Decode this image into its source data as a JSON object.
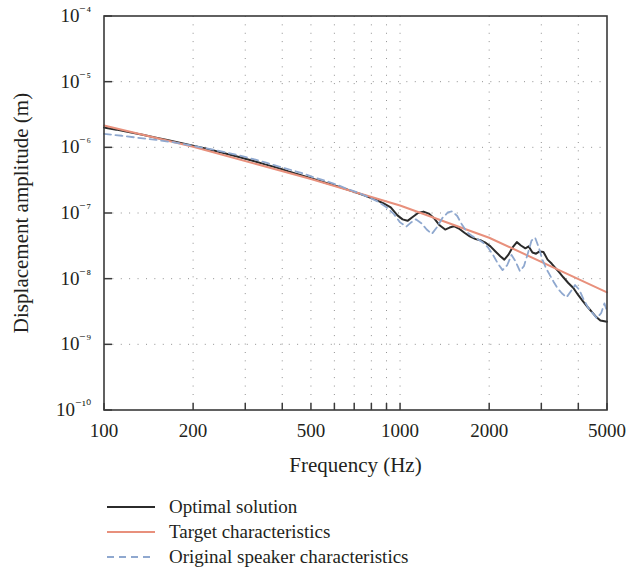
{
  "chart_data": {
    "type": "line",
    "title": "",
    "xlabel": "Frequency (Hz)",
    "ylabel": "Displacement amplitude (m)",
    "xscale": "log",
    "yscale": "log",
    "xlim": [
      100,
      5000
    ],
    "ylim": [
      1e-10,
      0.0001
    ],
    "grid": true,
    "grid_style": "dotted",
    "legend_position": "below-axes-left",
    "xticks": [
      100,
      200,
      500,
      1000,
      2000,
      5000
    ],
    "xtick_labels": [
      "100",
      "200",
      "500",
      "1000",
      "2000",
      "5000"
    ],
    "yticks": [
      1e-10,
      1e-09,
      1e-08,
      1e-07,
      1e-06,
      1e-05,
      0.0001
    ],
    "ytick_labels": [
      "10⁻¹⁰",
      "10⁻⁹",
      "10⁻⁸",
      "10⁻⁷",
      "10⁻⁶",
      "10⁻⁵",
      "10⁻⁴"
    ],
    "series": [
      {
        "name": "Optimal solution",
        "color": "#2b2b2b",
        "dash": "none",
        "width": 2.0,
        "points": [
          [
            100,
            2e-06
          ],
          [
            110,
            1.86e-06
          ],
          [
            120,
            1.72e-06
          ],
          [
            135,
            1.55e-06
          ],
          [
            150,
            1.4e-06
          ],
          [
            165,
            1.28e-06
          ],
          [
            180,
            1.18e-06
          ],
          [
            200,
            1.06e-06
          ],
          [
            220,
            9.6e-07
          ],
          [
            240,
            8.7e-07
          ],
          [
            265,
            7.8e-07
          ],
          [
            290,
            7e-07
          ],
          [
            320,
            6.2e-07
          ],
          [
            350,
            5.5e-07
          ],
          [
            385,
            4.9e-07
          ],
          [
            420,
            4.3e-07
          ],
          [
            460,
            3.8e-07
          ],
          [
            500,
            3.4e-07
          ],
          [
            545,
            3e-07
          ],
          [
            590,
            2.7e-07
          ],
          [
            640,
            2.4e-07
          ],
          [
            700,
            2.1e-07
          ],
          [
            760,
            1.85e-07
          ],
          [
            820,
            1.62e-07
          ],
          [
            880,
            1.4e-07
          ],
          [
            930,
            1.22e-07
          ],
          [
            980,
            9.2e-08
          ],
          [
            1020,
            8e-08
          ],
          [
            1060,
            7.6e-08
          ],
          [
            1100,
            8.6e-08
          ],
          [
            1150,
            1e-07
          ],
          [
            1200,
            1.05e-07
          ],
          [
            1250,
            9.8e-08
          ],
          [
            1300,
            8.4e-08
          ],
          [
            1360,
            6.5e-08
          ],
          [
            1420,
            5.6e-08
          ],
          [
            1470,
            6e-08
          ],
          [
            1520,
            6.3e-08
          ],
          [
            1580,
            5.8e-08
          ],
          [
            1650,
            5e-08
          ],
          [
            1720,
            4.4e-08
          ],
          [
            1800,
            4e-08
          ],
          [
            1880,
            3.8e-08
          ],
          [
            1950,
            3.5e-08
          ],
          [
            2020,
            3.1e-08
          ],
          [
            2100,
            2.6e-08
          ],
          [
            2180,
            2.2e-08
          ],
          [
            2250,
            1.95e-08
          ],
          [
            2320,
            2.3e-08
          ],
          [
            2400,
            3e-08
          ],
          [
            2480,
            3.6e-08
          ],
          [
            2560,
            3.2e-08
          ],
          [
            2650,
            2.9e-08
          ],
          [
            2720,
            3.1e-08
          ],
          [
            2800,
            2.5e-08
          ],
          [
            2880,
            2.4e-08
          ],
          [
            2960,
            2.6e-08
          ],
          [
            3050,
            2.55e-08
          ],
          [
            3150,
            1.95e-08
          ],
          [
            3250,
            1.7e-08
          ],
          [
            3350,
            1.45e-08
          ],
          [
            3450,
            1.25e-08
          ],
          [
            3560,
            1.05e-08
          ],
          [
            3700,
            8.6e-09
          ],
          [
            3850,
            7.2e-09
          ],
          [
            4000,
            5.6e-09
          ],
          [
            4150,
            4.5e-09
          ],
          [
            4300,
            3.7e-09
          ],
          [
            4450,
            3.1e-09
          ],
          [
            4600,
            2.6e-09
          ],
          [
            4750,
            2.3e-09
          ],
          [
            5000,
            2.2e-09
          ]
        ]
      },
      {
        "name": "Target characteristics",
        "color": "#e8907c",
        "dash": "none",
        "width": 2.0,
        "points": [
          [
            100,
            2.15e-06
          ],
          [
            200,
            1.02e-06
          ],
          [
            500,
            3.3e-07
          ],
          [
            1000,
            1.3e-07
          ],
          [
            2000,
            4.2e-08
          ],
          [
            5000,
            6.2e-09
          ]
        ]
      },
      {
        "name": "Original speaker characteristics",
        "color": "#8fa8cf",
        "dash": "dashed",
        "width": 1.8,
        "points": [
          [
            100,
            1.6e-06
          ],
          [
            115,
            1.5e-06
          ],
          [
            130,
            1.4e-06
          ],
          [
            150,
            1.3e-06
          ],
          [
            170,
            1.2e-06
          ],
          [
            190,
            1.1e-06
          ],
          [
            210,
            1.01e-06
          ],
          [
            235,
            9.2e-07
          ],
          [
            260,
            8.3e-07
          ],
          [
            290,
            7.4e-07
          ],
          [
            320,
            6.6e-07
          ],
          [
            355,
            5.8e-07
          ],
          [
            390,
            5.1e-07
          ],
          [
            430,
            4.5e-07
          ],
          [
            470,
            4e-07
          ],
          [
            510,
            3.5e-07
          ],
          [
            560,
            3.1e-07
          ],
          [
            610,
            2.7e-07
          ],
          [
            660,
            2.35e-07
          ],
          [
            720,
            2.05e-07
          ],
          [
            780,
            1.75e-07
          ],
          [
            840,
            1.5e-07
          ],
          [
            900,
            1.22e-07
          ],
          [
            950,
            9.8e-08
          ],
          [
            1000,
            7.2e-08
          ],
          [
            1050,
            6.2e-08
          ],
          [
            1090,
            7.2e-08
          ],
          [
            1130,
            8e-08
          ],
          [
            1180,
            7e-08
          ],
          [
            1230,
            5.6e-08
          ],
          [
            1280,
            4.8e-08
          ],
          [
            1330,
            6e-08
          ],
          [
            1390,
            8.4e-08
          ],
          [
            1450,
            1.02e-07
          ],
          [
            1500,
            1.06e-07
          ],
          [
            1560,
            9e-08
          ],
          [
            1620,
            6.6e-08
          ],
          [
            1690,
            5e-08
          ],
          [
            1760,
            4.4e-08
          ],
          [
            1830,
            4e-08
          ],
          [
            1900,
            3.6e-08
          ],
          [
            1980,
            3e-08
          ],
          [
            2060,
            2.3e-08
          ],
          [
            2140,
            1.7e-08
          ],
          [
            2220,
            1.35e-08
          ],
          [
            2300,
            1.6e-08
          ],
          [
            2380,
            2.3e-08
          ],
          [
            2460,
            1.8e-08
          ],
          [
            2540,
            1.3e-08
          ],
          [
            2620,
            1.55e-08
          ],
          [
            2700,
            2.4e-08
          ],
          [
            2780,
            3.8e-08
          ],
          [
            2860,
            4.2e-08
          ],
          [
            2940,
            3e-08
          ],
          [
            3020,
            2e-08
          ],
          [
            3110,
            1.45e-08
          ],
          [
            3200,
            1.15e-08
          ],
          [
            3300,
            9e-09
          ],
          [
            3400,
            7.2e-09
          ],
          [
            3520,
            6e-09
          ],
          [
            3650,
            5.2e-09
          ],
          [
            3780,
            6.5e-09
          ],
          [
            3900,
            8e-09
          ],
          [
            4030,
            6.8e-09
          ],
          [
            4170,
            4.8e-09
          ],
          [
            4320,
            3.6e-09
          ],
          [
            4470,
            3e-09
          ],
          [
            4620,
            2.5e-09
          ],
          [
            4780,
            3e-09
          ],
          [
            4900,
            4.2e-09
          ],
          [
            5000,
            3.2e-09
          ]
        ]
      }
    ]
  },
  "legend": {
    "items": [
      {
        "label": "Optimal solution",
        "color": "#2b2b2b",
        "dash": "none"
      },
      {
        "label": "Target characteristics",
        "color": "#e8907c",
        "dash": "none"
      },
      {
        "label": "Original speaker characteristics",
        "color": "#8fa8cf",
        "dash": "dashed"
      }
    ]
  },
  "axes": {
    "left": 104,
    "right": 607,
    "top": 16,
    "bottom": 410
  }
}
